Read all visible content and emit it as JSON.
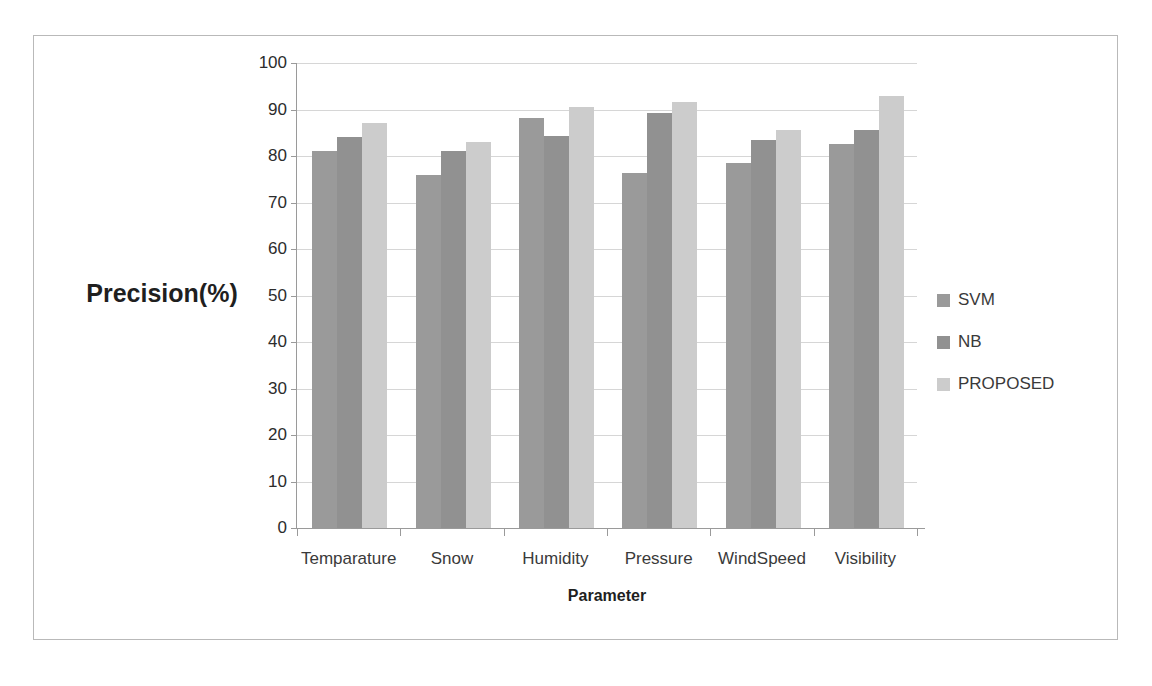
{
  "chart_data": {
    "type": "bar",
    "title": "",
    "xlabel": "Parameter",
    "ylabel": "Precision(%)",
    "categories": [
      "Temparature",
      "Snow",
      "Humidity",
      "Pressure",
      "WindSpeed",
      "Visibility"
    ],
    "series": [
      {
        "name": "SVM",
        "color": "#9a9a9a",
        "values": [
          81.0,
          76.0,
          88.2,
          76.3,
          78.6,
          82.6
        ]
      },
      {
        "name": "NB",
        "color": "#919191",
        "values": [
          84.0,
          81.0,
          84.3,
          89.3,
          83.4,
          85.7
        ]
      },
      {
        "name": "PROPOSED",
        "color": "#cccccc",
        "values": [
          87.0,
          83.0,
          90.6,
          91.6,
          85.5,
          92.8
        ]
      }
    ],
    "ylim": [
      0,
      100
    ],
    "ytick_step": 10,
    "yticks": [
      "100",
      "90",
      "80",
      "70",
      "60",
      "50",
      "40",
      "30",
      "20",
      "10",
      "0"
    ],
    "grid": true,
    "legend_position": "right"
  },
  "colors": {
    "frame_border": "#b9b9b9",
    "gridline": "#d6d6d6",
    "axis_line": "#9a9a9a",
    "tick_text": "#2c2c2c",
    "label_text": "#3a3a3a",
    "title_text": "#1f1f1f",
    "background": "#ffffff"
  }
}
